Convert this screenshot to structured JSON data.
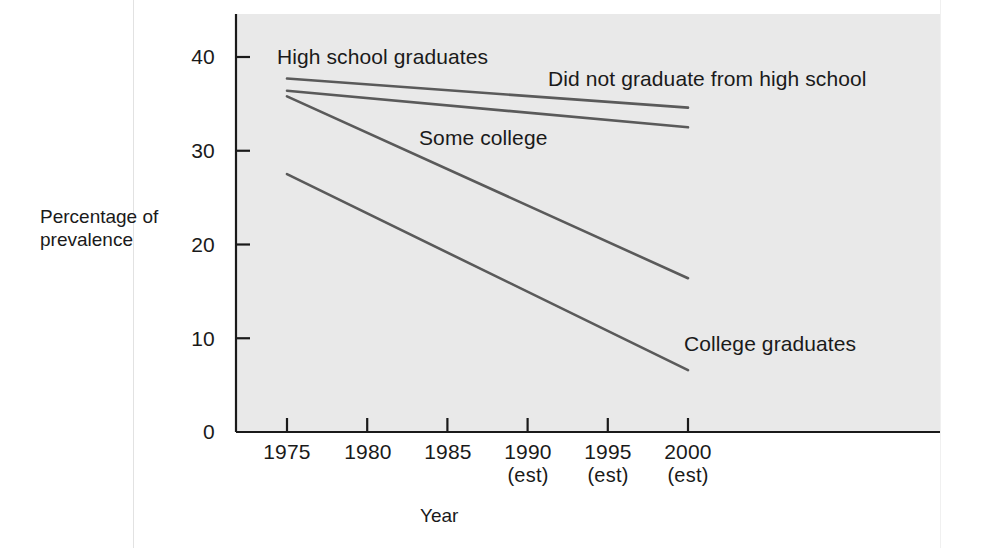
{
  "figure": {
    "background_color": "#ffffff",
    "plot_background_color": "#e9e9e9",
    "line_color": "#5a5a5a",
    "axis_color": "#1a1a1a"
  },
  "chart_data": {
    "type": "line",
    "title": "",
    "xlabel": "Year",
    "ylabel": "Percentage of prevalence",
    "ylabel_lines": [
      "Percentage of",
      "prevalence"
    ],
    "x": [
      1975,
      2000
    ],
    "categories": [
      "1975",
      "1980",
      "1985",
      "1990",
      "1995",
      "2000"
    ],
    "tick_notes": [
      "",
      "",
      "",
      "(est)",
      "(est)",
      "(est)"
    ],
    "xtick_labels": [
      {
        "year": "1975",
        "note": ""
      },
      {
        "year": "1980",
        "note": ""
      },
      {
        "year": "1985",
        "note": ""
      },
      {
        "year": "1990",
        "note": "(est)"
      },
      {
        "year": "1995",
        "note": "(est)"
      },
      {
        "year": "2000",
        "note": "(est)"
      }
    ],
    "ytick_labels": [
      "40",
      "30",
      "20",
      "10",
      "0"
    ],
    "ytick_values": [
      40,
      30,
      20,
      10,
      0
    ],
    "ylim": [
      0,
      44.5
    ],
    "xlim": [
      1972,
      2008.5
    ],
    "grid": false,
    "legend_position": "inline-annotations",
    "series": [
      {
        "name": "High school graduates",
        "label": "High school graduates",
        "values": [
          37.7,
          34.6
        ],
        "x": [
          1975,
          2000
        ],
        "label_x": 1979.0,
        "label_y": 40.6
      },
      {
        "name": "Did not graduate from high school",
        "label": "Did not graduate from high school",
        "values": [
          36.4,
          32.5
        ],
        "x": [
          1975,
          2000
        ],
        "label_x": 1992.6,
        "label_y": 38.0
      },
      {
        "name": "Some college",
        "label": "Some college",
        "values": [
          35.8,
          16.4
        ],
        "x": [
          1975,
          2000
        ],
        "label_x": 1984.0,
        "label_y": 31.8
      },
      {
        "name": "College graduates",
        "label": "College graduates",
        "values": [
          27.5,
          6.6
        ],
        "x": [
          1975,
          2000
        ],
        "label_x": 1997.0,
        "label_y": 10.4
      }
    ]
  }
}
